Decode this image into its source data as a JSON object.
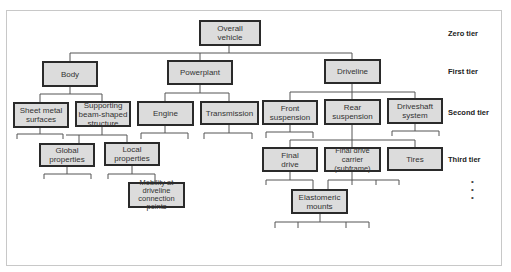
{
  "tiers": {
    "zero": "Zero tier",
    "first": "First tier",
    "second": "Second tier",
    "third": "Third tier",
    "continuation": "•\n•\n•"
  },
  "nodes": {
    "overall_vehicle": "Overall\nvehicle",
    "body": "Body",
    "powerplant": "Powerplant",
    "driveline": "Driveline",
    "sheet_metal": "Sheet metal\nsurfaces",
    "supporting_structure": "Supporting\nbeam-shaped\nstructure",
    "engine": "Engine",
    "transmission": "Transmission",
    "front_suspension": "Front\nsuspension",
    "rear_suspension": "Rear\nsuspension",
    "driveshaft": "Driveshaft\nsystem",
    "global_properties": "Global\nproperties",
    "local_properties": "Local\nproperties",
    "mobility": "Mobility at\ndriveline\nconnection points",
    "final_drive": "Final\ndrive",
    "final_drive_carrier": "Final drive\ncarrier (subframe)",
    "tires": "Tires",
    "elastomeric_mounts": "Elastomeric\nmounts"
  },
  "colors": {
    "box_fill": "#dcdcdc",
    "box_border": "#2a2a2a",
    "line": "#555555",
    "frame": "#c8c8c8"
  }
}
